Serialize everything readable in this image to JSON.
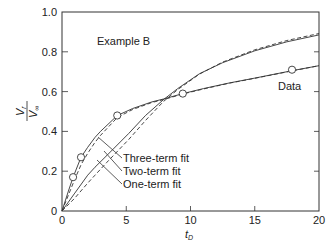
{
  "chart_data": {
    "type": "line",
    "title": "",
    "annotation": "Example B",
    "xlabel": "t",
    "xlabel_sub": "D",
    "ylabel_num": "V",
    "ylabel_num_sub": "r",
    "ylabel_den": "V",
    "ylabel_den_sub": "∞",
    "xlim": [
      0,
      20
    ],
    "ylim": [
      0,
      1.0
    ],
    "xticks": [
      0,
      5,
      10,
      15,
      20
    ],
    "xtick_labels": [
      "0",
      "5",
      "10",
      "15",
      "20"
    ],
    "yticks": [
      0,
      0.2,
      0.4,
      0.6,
      0.8,
      1.0
    ],
    "ytick_labels": [
      "0",
      "0.2",
      "0.4",
      "0.6",
      "0.8",
      "1.0"
    ],
    "grid": false,
    "data_points": {
      "name": "Data",
      "x": [
        0.86,
        1.48,
        4.3,
        9.4,
        17.9
      ],
      "y": [
        0.17,
        0.27,
        0.48,
        0.59,
        0.71
      ]
    },
    "series": [
      {
        "name": "Three-term fit",
        "style": "solid",
        "x": [
          0,
          0.5,
          0.86,
          1.48,
          2.0,
          2.57,
          3.0,
          4.3,
          5.5,
          7.0,
          7.9,
          9.4,
          11,
          13,
          15,
          17.9,
          20
        ],
        "y": [
          0,
          0.1,
          0.17,
          0.27,
          0.32,
          0.37,
          0.4,
          0.48,
          0.515,
          0.548,
          0.563,
          0.59,
          0.615,
          0.643,
          0.668,
          0.705,
          0.73
        ]
      },
      {
        "name": "Three-term fit (dashed)",
        "style": "dashed",
        "x": [
          0,
          0.5,
          1.0,
          1.5,
          2.0,
          2.57,
          3.0,
          4.3,
          5.5,
          7.0,
          7.9,
          9.4,
          11,
          13,
          15,
          17.9,
          20
        ],
        "y": [
          0,
          0.08,
          0.16,
          0.235,
          0.29,
          0.345,
          0.38,
          0.47,
          0.51,
          0.545,
          0.56,
          0.588,
          0.613,
          0.642,
          0.667,
          0.704,
          0.73
        ]
      },
      {
        "name": "Two-term fit",
        "style": "solid",
        "x": [
          0,
          1.0,
          2.0,
          2.57,
          3.5,
          5.2,
          6.5,
          7.9,
          9.0,
          10.7,
          12.5,
          15,
          17.5,
          20
        ],
        "y": [
          0,
          0.09,
          0.18,
          0.22,
          0.28,
          0.39,
          0.48,
          0.56,
          0.615,
          0.69,
          0.745,
          0.805,
          0.85,
          0.885
        ]
      },
      {
        "name": "One-term fit",
        "style": "dashed",
        "x": [
          0,
          1.0,
          2.0,
          2.57,
          3.5,
          5.2,
          6.5,
          7.9,
          9.0,
          10.7,
          12.5,
          15,
          17.5,
          20
        ],
        "y": [
          0,
          0.065,
          0.14,
          0.18,
          0.245,
          0.36,
          0.455,
          0.55,
          0.61,
          0.688,
          0.748,
          0.81,
          0.857,
          0.892
        ]
      }
    ],
    "labels": {
      "three_term": "Three-term fit",
      "two_term": "Two-term fit",
      "one_term": "One-term fit",
      "data": "Data"
    }
  }
}
